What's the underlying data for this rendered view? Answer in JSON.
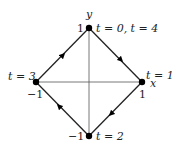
{
  "diagram": {
    "axes": {
      "x_label": "x",
      "y_label": "y"
    },
    "vertices": [
      {
        "id": "top",
        "coord_label": "1",
        "time_label": "t = 0, t = 4",
        "x": 89,
        "y": 28
      },
      {
        "id": "right",
        "coord_label": "1",
        "time_label": "t = 1",
        "x": 142,
        "y": 82
      },
      {
        "id": "bottom",
        "coord_label": "−1",
        "time_label": "t = 2",
        "x": 89,
        "y": 136
      },
      {
        "id": "left",
        "coord_label": "−1",
        "time_label": "t = 3",
        "x": 36,
        "y": 82
      }
    ],
    "edges": [
      {
        "from": "top",
        "to": "right",
        "direction": "clockwise"
      },
      {
        "from": "right",
        "to": "bottom",
        "direction": "clockwise"
      },
      {
        "from": "bottom",
        "to": "left",
        "direction": "clockwise"
      },
      {
        "from": "left",
        "to": "top",
        "direction": "clockwise"
      }
    ],
    "colors": {
      "line": "#222222",
      "axis": "#555555",
      "point": "#000000"
    }
  }
}
